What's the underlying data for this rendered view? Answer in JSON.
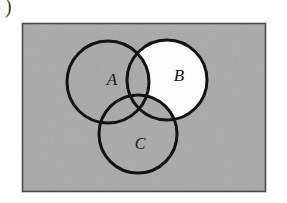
{
  "figure": {
    "kind": "venn-diagram",
    "caption_fragment": ")",
    "canvas": {
      "width": 287,
      "height": 203
    },
    "background_color": "#ffffff"
  },
  "universe": {
    "name": "universal-set-rectangle",
    "fill_color": "#a8a8a8",
    "border_color": "#4a4a4a",
    "x": 22,
    "y": 23,
    "width": 244,
    "height": 169
  },
  "colors": {
    "shaded_region": "#fdfdfd",
    "unshaded_region": "#a8a8a8",
    "stroke": "#121212",
    "label_text": "#121212"
  },
  "sets": [
    {
      "label": "A",
      "name": "circle-a",
      "cx": 108,
      "cy": 82,
      "r": 41,
      "fill": "#a8a8a8",
      "shaded": false,
      "label_x": 112,
      "label_y": 81,
      "label_size": 17
    },
    {
      "label": "B",
      "name": "circle-b",
      "cx": 167,
      "cy": 80,
      "r": 40,
      "fill": "#fdfdfd",
      "shaded": true,
      "label_x": 179,
      "label_y": 77,
      "label_size": 17
    },
    {
      "label": "C",
      "name": "circle-c",
      "cx": 138,
      "cy": 134,
      "r": 39,
      "fill": "#a8a8a8",
      "shaded": false,
      "label_x": 140,
      "label_y": 145,
      "label_size": 16
    }
  ],
  "stroke_width": 3,
  "shaded_description": "B minus the union of A and C"
}
